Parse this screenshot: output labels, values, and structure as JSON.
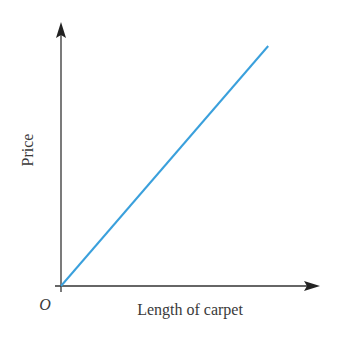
{
  "chart_data": {
    "type": "line",
    "title": "",
    "xlabel": "Length of carpet",
    "ylabel": "Price",
    "origin_label": "O",
    "grid": false,
    "ticks": false,
    "legend": null,
    "series": [
      {
        "name": "Price vs length",
        "color": "#3aa0dc",
        "x": [
          0,
          1
        ],
        "y": [
          0,
          1
        ]
      }
    ],
    "xlim": [
      0,
      1.25
    ],
    "ylim": [
      0,
      1.1
    ]
  },
  "colors": {
    "axis": "#333333",
    "line": "#3aa0dc",
    "text": "#3a3a3a"
  }
}
